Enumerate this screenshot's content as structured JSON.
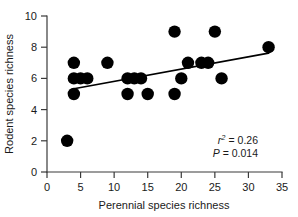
{
  "chart_data": {
    "type": "scatter",
    "title": "",
    "xlabel": "Perennial species richness",
    "ylabel": "Rodent species richness",
    "xlim": [
      0,
      35
    ],
    "ylim": [
      0,
      10
    ],
    "xticks": [
      0,
      5,
      10,
      15,
      20,
      25,
      30,
      35
    ],
    "yticks": [
      0,
      2,
      4,
      6,
      8,
      10
    ],
    "grid": false,
    "legend": null,
    "marker": "filled-circle",
    "marker_color": "#000000",
    "points": [
      {
        "x": 3,
        "y": 2
      },
      {
        "x": 4,
        "y": 5
      },
      {
        "x": 4,
        "y": 6
      },
      {
        "x": 4,
        "y": 7
      },
      {
        "x": 5,
        "y": 6
      },
      {
        "x": 6,
        "y": 6
      },
      {
        "x": 9,
        "y": 7
      },
      {
        "x": 12,
        "y": 5
      },
      {
        "x": 12,
        "y": 6
      },
      {
        "x": 13,
        "y": 6
      },
      {
        "x": 14,
        "y": 6
      },
      {
        "x": 15,
        "y": 5
      },
      {
        "x": 19,
        "y": 9
      },
      {
        "x": 19,
        "y": 5
      },
      {
        "x": 20,
        "y": 6
      },
      {
        "x": 21,
        "y": 7
      },
      {
        "x": 23,
        "y": 7
      },
      {
        "x": 24,
        "y": 7
      },
      {
        "x": 25,
        "y": 9
      },
      {
        "x": 26,
        "y": 6
      },
      {
        "x": 33,
        "y": 8
      }
    ],
    "fit_line": {
      "x_start": 3.8,
      "y_start": 5.32,
      "x_end": 33.0,
      "y_end": 7.62
    },
    "annotations": {
      "r_squared_symbol": "r",
      "r_squared_exponent": "2",
      "r_squared_value": "= 0.26",
      "p_symbol": "P",
      "p_value": "= 0.014"
    }
  }
}
